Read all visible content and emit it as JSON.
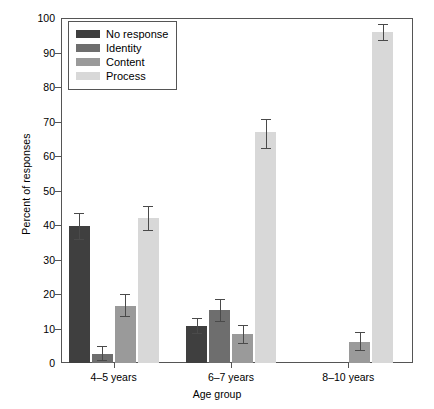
{
  "chart_data": {
    "type": "bar",
    "title": "",
    "xlabel": "Age group",
    "ylabel": "Percent of responses",
    "ylim": [
      0,
      100
    ],
    "ytick_step": 10,
    "yticks": [
      0,
      10,
      20,
      30,
      40,
      50,
      60,
      70,
      80,
      90,
      100
    ],
    "ytick_labels": [
      "0",
      "10",
      "20",
      "30",
      "40",
      "50",
      "60",
      "70",
      "80",
      "90",
      "100"
    ],
    "categories": [
      "4–5 years",
      "6–7 years",
      "8–10 years"
    ],
    "grid": false,
    "legend_position": "upper-left-inside",
    "series": [
      {
        "name": "No response",
        "color": "#3f3f3f",
        "values": [
          39.7,
          10.8,
          0.0
        ],
        "errors_low": [
          35.8,
          8.6,
          0.0
        ],
        "errors_high": [
          43.5,
          13.0,
          0.0
        ]
      },
      {
        "name": "Identity",
        "color": "#6e6e6e",
        "values": [
          2.5,
          15.5,
          0.0
        ],
        "errors_low": [
          0.9,
          12.2,
          0.0
        ],
        "errors_high": [
          4.9,
          18.6,
          0.0
        ]
      },
      {
        "name": "Content",
        "color": "#9a9a9a",
        "values": [
          16.5,
          8.3,
          6.2
        ],
        "errors_low": [
          13.5,
          5.9,
          3.9
        ],
        "errors_high": [
          20.0,
          11.1,
          9.0
        ]
      },
      {
        "name": "Process",
        "color": "#d8d8d8",
        "values": [
          42.0,
          67.0,
          96.0
        ],
        "errors_low": [
          38.6,
          62.2,
          93.6
        ],
        "errors_high": [
          45.4,
          70.6,
          98.4
        ]
      }
    ]
  },
  "axis": {
    "frame_color": "#555555",
    "error_bar_color": "#4a4a4a"
  }
}
